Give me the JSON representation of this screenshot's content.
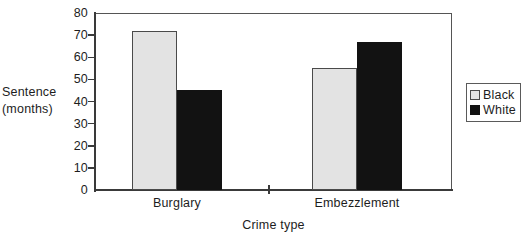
{
  "chart_data": {
    "type": "bar",
    "title": "",
    "categories": [
      "Burglary",
      "Embezzlement"
    ],
    "series": [
      {
        "name": "Black",
        "color": "#e3e3e3",
        "values": [
          72,
          55
        ]
      },
      {
        "name": "White",
        "color": "#121212",
        "values": [
          45,
          67
        ]
      }
    ],
    "xlabel": "Crime type",
    "ylabel": "Sentence\n(months)",
    "ylabel_line1": "Sentence",
    "ylabel_line2": "(months)",
    "ylim": [
      0,
      80
    ],
    "ytick_labels": [
      "0",
      "10",
      "20",
      "30",
      "40",
      "50",
      "60",
      "70",
      "80"
    ],
    "ytick_values": [
      0,
      10,
      20,
      30,
      40,
      50,
      60,
      70,
      80
    ],
    "grid": false,
    "legend_position": "right-outside"
  },
  "legend": {
    "entries": [
      {
        "label": "Black"
      },
      {
        "label": "White"
      }
    ]
  },
  "axes": {
    "y_title_line1": "Sentence",
    "y_title_line2": "(months)",
    "x_title": "Crime type"
  }
}
